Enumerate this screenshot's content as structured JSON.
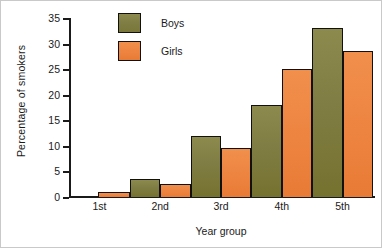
{
  "chart_data": {
    "type": "bar",
    "title": "",
    "xlabel": "Year group",
    "ylabel": "Percentage of smokers",
    "categories": [
      "1st",
      "2nd",
      "3rd",
      "4th",
      "5th"
    ],
    "series": [
      {
        "name": "Boys",
        "color": "#807d44",
        "values": [
          0,
          3.5,
          12,
          18,
          33
        ]
      },
      {
        "name": "Girls",
        "color": "#ed8440",
        "values": [
          1,
          2.5,
          9.5,
          25,
          28.5
        ]
      }
    ],
    "ylim": [
      0,
      35
    ],
    "ytick_labels": [
      "0",
      "5",
      "10",
      "15",
      "20",
      "25",
      "30",
      "35"
    ],
    "ytick_values": [
      0,
      5,
      10,
      15,
      20,
      25,
      30,
      35
    ],
    "grid": false,
    "legend_position": "top-left-inside",
    "bar_gap": "none",
    "bar_outline_color": "#111111",
    "background_color": "#ffffff"
  }
}
